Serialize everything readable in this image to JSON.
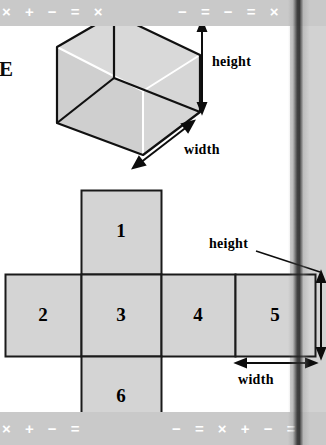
{
  "page": {
    "background_color": "#ffffff",
    "band_color": "#c9c9c9",
    "shape_fill": "#d4d4d4",
    "shape_stroke": "#1a1a1a",
    "edge_letter": "E"
  },
  "decor_band": {
    "top_left_symbols": "× + − = ×",
    "top_right_symbols": "− = − = ×",
    "bottom_left_symbols": "× + − =",
    "bottom_right_symbols": "− = × + − ="
  },
  "cube_figure": {
    "name": "transparent-cube",
    "height_label": "height",
    "width_label": "width"
  },
  "net_figure": {
    "name": "cube-net",
    "height_label": "height",
    "width_label": "width",
    "faces": [
      {
        "number": "1",
        "position": "top"
      },
      {
        "number": "2",
        "position": "middle-left"
      },
      {
        "number": "3",
        "position": "middle-center"
      },
      {
        "number": "4",
        "position": "middle-right"
      },
      {
        "number": "5",
        "position": "middle-far-right"
      },
      {
        "number": "6",
        "position": "bottom"
      }
    ]
  }
}
